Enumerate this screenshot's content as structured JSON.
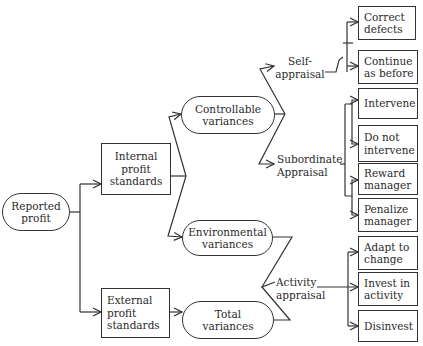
{
  "nodes": {
    "reported_profit": "Reported\nprofit",
    "internal_standards": "Internal\nprofit\nstandards",
    "external_standards": "External\nprofit\nstandards",
    "controllable_variances": "Controllable\nvariances",
    "environmental_variances": "Environmental\nvariances",
    "total_variances": "Total\nvariances"
  },
  "labels": {
    "self_appraisal": "Self-\nappraisal",
    "subordinate_appraisal": "Subordinate\nAppraisal",
    "activity_appraisal": "Activity\nappraisal"
  },
  "outcomes": {
    "self": [
      "Correct\ndefects",
      "Continue\nas before"
    ],
    "subordinate": [
      "Intervene",
      "Do not\nintervene",
      "Reward\nmanager",
      "Penalize\nmanager"
    ],
    "activity": [
      "Adapt to\nchange",
      "Invest in\nactivity",
      "Disinvest"
    ]
  },
  "colors": {
    "line": "#333333",
    "background": "#ffffff"
  }
}
